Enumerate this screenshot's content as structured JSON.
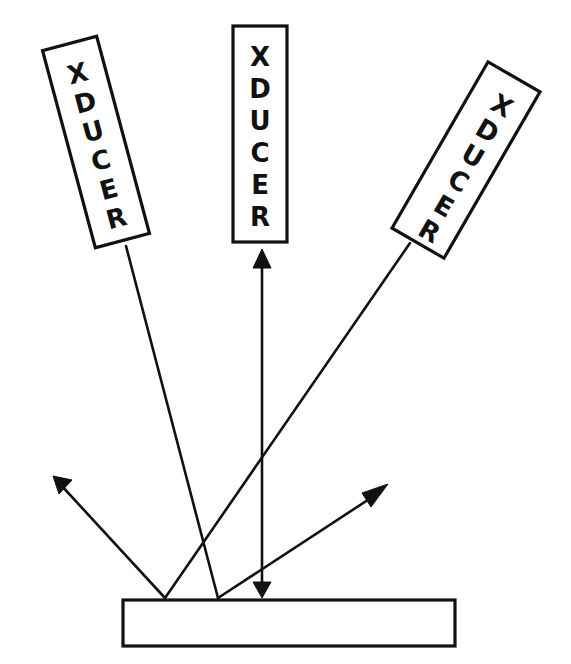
{
  "diagram": {
    "title": "",
    "transducers": [
      {
        "id": "left",
        "label_letters": [
          "X",
          "D",
          "U",
          "C",
          "E",
          "R"
        ],
        "label": "XDUCER"
      },
      {
        "id": "center",
        "label_letters": [
          "X",
          "D",
          "U",
          "C",
          "E",
          "R"
        ],
        "label": "XDUCER"
      },
      {
        "id": "right",
        "label_letters": [
          "X",
          "D",
          "U",
          "C",
          "E",
          "R"
        ],
        "label": "XDUCER"
      }
    ],
    "reflector": {
      "label": ""
    },
    "colors": {
      "ink": "#111111",
      "background": "#ffffff"
    }
  }
}
